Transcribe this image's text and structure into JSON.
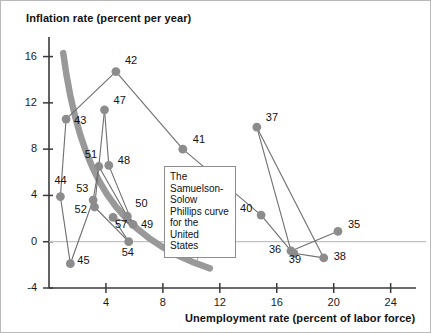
{
  "figure": {
    "y_axis_title": "Inflation rate (percent per year)",
    "x_axis_title": "Unemployment rate (percent of labor force)",
    "annotation": "The Samuelson-Solow Phillips curve for the United States"
  },
  "chart_data": {
    "type": "scatter",
    "title": "",
    "xlabel": "Unemployment rate (percent of labor force)",
    "ylabel": "Inflation rate (percent per year)",
    "xlim": [
      0,
      25.5
    ],
    "ylim": [
      -4,
      17
    ],
    "xticks": [
      4,
      8,
      12,
      16,
      20,
      24
    ],
    "yticks": [
      16,
      12,
      8,
      4,
      0,
      -4
    ],
    "grid": false,
    "legend": null,
    "zero_line": true,
    "annotations": [
      {
        "text": "The Samuelson-Solow Phillips curve for the United States",
        "points_to": "thick-gray-phillips-curve"
      }
    ],
    "marker_color": "#8c8c8c",
    "line_color": "#6e6e6e",
    "curve_color": "#999999",
    "series": [
      {
        "name": "US inflation vs unemployment (year labels)",
        "connected": true,
        "points": [
          {
            "label": "35",
            "x": 20.3,
            "y": 0.9
          },
          {
            "label": "36",
            "x": 17.0,
            "y": -0.8
          },
          {
            "label": "37",
            "x": 14.6,
            "y": 9.9
          },
          {
            "label": "38",
            "x": 19.3,
            "y": -1.4
          },
          {
            "label": "39",
            "x": 17.2,
            "y": -1.0
          },
          {
            "label": "40",
            "x": 14.9,
            "y": 2.3
          },
          {
            "label": "41",
            "x": 9.4,
            "y": 8.0
          },
          {
            "label": "42",
            "x": 4.7,
            "y": 14.7
          },
          {
            "label": "43",
            "x": 1.2,
            "y": 10.6
          },
          {
            "label": "44",
            "x": 0.8,
            "y": 3.9
          },
          {
            "label": "45",
            "x": 1.5,
            "y": -1.9
          },
          {
            "label": "47",
            "x": 3.9,
            "y": 11.4
          },
          {
            "label": "48",
            "x": 4.2,
            "y": 6.6
          },
          {
            "label": "49",
            "x": 5.9,
            "y": 1.5
          },
          {
            "label": "50",
            "x": 5.5,
            "y": 2.2
          },
          {
            "label": "51",
            "x": 3.5,
            "y": 6.5
          },
          {
            "label": "52",
            "x": 3.2,
            "y": 3.0
          },
          {
            "label": "53",
            "x": 3.1,
            "y": 3.6
          },
          {
            "label": "54",
            "x": 5.6,
            "y": 0.0
          },
          {
            "label": "57",
            "x": 4.5,
            "y": 2.1
          }
        ]
      }
    ],
    "phillips_curve": {
      "description": "Samuelson-Solow Phillips curve, thick gray downward-sloping curve",
      "start": {
        "x": 1.0,
        "y": 16.3
      },
      "end": {
        "x": 11.3,
        "y": -2.3
      }
    }
  }
}
